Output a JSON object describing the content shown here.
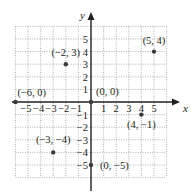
{
  "diagram": {
    "type": "coordinate-plane",
    "axes": {
      "x_label": "x",
      "y_label": "y",
      "x_ticks": [
        "−5",
        "−4",
        "−3",
        "−2",
        "−1",
        "1",
        "2",
        "3",
        "4",
        "5"
      ],
      "x_tick_values": [
        -5,
        -4,
        -3,
        -2,
        -1,
        1,
        2,
        3,
        4,
        5
      ],
      "y_ticks": [
        "5",
        "4",
        "3",
        "2",
        "1",
        "−1",
        "−2",
        "−3",
        "−4",
        "−5"
      ],
      "y_tick_values": [
        5,
        4,
        3,
        2,
        1,
        -1,
        -2,
        -3,
        -4,
        -5
      ],
      "grid_range": {
        "x": [
          -6,
          6
        ],
        "y": [
          -6,
          6
        ]
      },
      "grid": "dotted"
    },
    "points": [
      {
        "label": "(5, 4)",
        "x": 5,
        "y": 4
      },
      {
        "label": "(−2, 3)",
        "x": -2,
        "y": 3
      },
      {
        "label": "(−6, 0)",
        "x": -6,
        "y": 0
      },
      {
        "label": "(0, 0)",
        "x": 0,
        "y": 0
      },
      {
        "label": "(4, −1)",
        "x": 4,
        "y": -1
      },
      {
        "label": "(−3, −4)",
        "x": -3,
        "y": -4
      },
      {
        "label": "(0, −5)",
        "x": 0,
        "y": -5
      }
    ],
    "colors": {
      "axis": "#231f20",
      "grid": "#9a9a9a",
      "point": "#3a3a3a",
      "text": "#231f20"
    }
  }
}
